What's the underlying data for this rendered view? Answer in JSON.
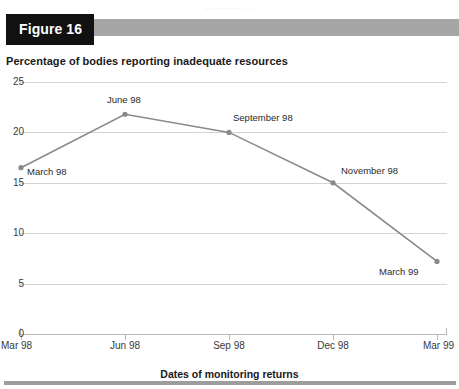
{
  "page": {
    "top_bleed_text": "....   ....  ...    ..  .    ..",
    "figure_tag": "Figure 16",
    "x_axis_title": "Dates of monitoring returns"
  },
  "chart_data": {
    "type": "line",
    "title": "Percentage of bodies reporting inadequate resources",
    "xlabel": "Dates of monitoring returns",
    "ylabel": "",
    "grid": true,
    "legend": "none",
    "ylim": [
      0,
      25
    ],
    "y_ticks": [
      "0",
      "5",
      "10",
      "15",
      "20",
      "25"
    ],
    "y_tick_values": [
      0,
      5,
      10,
      15,
      20,
      25
    ],
    "x_ticks": [
      "Mar 98",
      "Jun 98",
      "Sep 98",
      "Dec 98",
      "Mar 99"
    ],
    "categories": [
      "March 98",
      "June 98",
      "September 98",
      "November 98",
      "March 99"
    ],
    "values": [
      16.5,
      21.8,
      20.0,
      15.0,
      7.2
    ],
    "point_labels": [
      "March 98",
      "June 98",
      "September 98",
      "November 98",
      "March 99"
    ],
    "series": [
      {
        "name": "Percentage of bodies reporting inadequate resources",
        "values": [
          16.5,
          21.8,
          20.0,
          15.0,
          7.2
        ]
      }
    ],
    "colors": {
      "line": "#8a8a8a",
      "marker": "#8a8a8a",
      "grid": "#d4d4d4",
      "banner_tag": "#111111",
      "banner_bar": "#a6a6a6",
      "bottom_rule": "#9d9d9d"
    }
  }
}
